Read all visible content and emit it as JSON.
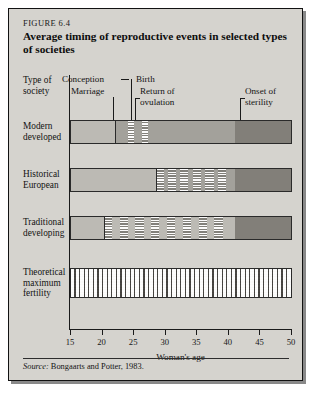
{
  "figure": {
    "number_label": "FIGURE 6.4",
    "title": "Average timing of reproductive events in selected types of societies",
    "source_prefix": "Source:",
    "source_text": "Bongaarts and Potter, 1983."
  },
  "column_heading": {
    "line1": "Type of",
    "line2": "society"
  },
  "callouts": [
    {
      "name": "conception",
      "label": "Conception",
      "age": 23.0
    },
    {
      "name": "birth",
      "label": "Birth",
      "age": 24.4
    },
    {
      "name": "marriage",
      "label": "Marriage",
      "age": 22.0
    },
    {
      "name": "return-of-ovulation",
      "label_line1": "Return of",
      "label_line2": "ovulation",
      "age": 26.4
    },
    {
      "name": "onset-of-sterility",
      "label_line1": "Onset of",
      "label_line2": "sterility",
      "age": 41.0
    }
  ],
  "rows": [
    {
      "name": "modern-developed",
      "label_line1": "Modern",
      "label_line2": "developed",
      "label_line3": ""
    },
    {
      "name": "historical-european",
      "label_line1": "Historical",
      "label_line2": "European",
      "label_line3": ""
    },
    {
      "name": "traditional-developing",
      "label_line1": "Traditional",
      "label_line2": "developing",
      "label_line3": ""
    },
    {
      "name": "theoretical-maximum-fertility",
      "label_line1": "Theoretical",
      "label_line2": "maximum",
      "label_line3": "fertility"
    }
  ],
  "colors": {
    "panel_background": "#d5d3ce",
    "bar_light": "#bcbab4",
    "bar_mid": "#a3a19b",
    "bar_dark": "#827f79",
    "frame": "#121212",
    "text": "#121212"
  },
  "chart_data": {
    "type": "bar",
    "title": "Average timing of reproductive events in selected types of societies",
    "subtitle": "FIGURE 6.4",
    "xlabel": "Woman's age",
    "ylabel": "Type of society",
    "xlim": [
      15,
      50
    ],
    "xticks": [
      15,
      20,
      25,
      30,
      35,
      40,
      45,
      50
    ],
    "grid": false,
    "legend": "none",
    "orientation": "horizontal-timeline",
    "segment_legend": [
      {
        "key": "light",
        "meaning": "not exposed / non-reproductive interval"
      },
      {
        "key": "mid",
        "meaning": "exposed to conception risk (married)"
      },
      {
        "key": "hatch",
        "meaning": "pregnancy / postpartum infecundability"
      },
      {
        "key": "dark",
        "meaning": "sterile period after onset of sterility"
      }
    ],
    "categories": [
      "Modern developed",
      "Historical European",
      "Traditional developing",
      "Theoretical maximum fertility"
    ],
    "series": [
      {
        "name": "Modern developed",
        "segments": [
          {
            "fill": "light",
            "from": 15.0,
            "to": 22.0
          },
          {
            "fill": "mid",
            "from": 22.0,
            "to": 24.0
          },
          {
            "fill": "hatch",
            "from": 24.0,
            "to": 25.0
          },
          {
            "fill": "mid",
            "from": 25.0,
            "to": 26.3
          },
          {
            "fill": "hatch",
            "from": 26.3,
            "to": 27.2
          },
          {
            "fill": "mid",
            "from": 27.2,
            "to": 41.0
          },
          {
            "fill": "dark",
            "from": 41.0,
            "to": 50.0
          }
        ],
        "rules": [
          22.0
        ]
      },
      {
        "name": "Historical European",
        "segments": [
          {
            "fill": "light",
            "from": 15.0,
            "to": 28.5
          },
          {
            "fill": "hatch",
            "from": 28.5,
            "to": 29.8
          },
          {
            "fill": "mid",
            "from": 29.8,
            "to": 30.4
          },
          {
            "fill": "hatch",
            "from": 30.4,
            "to": 31.7
          },
          {
            "fill": "mid",
            "from": 31.7,
            "to": 32.3
          },
          {
            "fill": "hatch",
            "from": 32.3,
            "to": 33.6
          },
          {
            "fill": "mid",
            "from": 33.6,
            "to": 34.3
          },
          {
            "fill": "hatch",
            "from": 34.3,
            "to": 35.6
          },
          {
            "fill": "mid",
            "from": 35.6,
            "to": 36.3
          },
          {
            "fill": "hatch",
            "from": 36.3,
            "to": 37.6
          },
          {
            "fill": "mid",
            "from": 37.6,
            "to": 38.3
          },
          {
            "fill": "hatch",
            "from": 38.3,
            "to": 39.6
          },
          {
            "fill": "mid",
            "from": 39.6,
            "to": 41.0
          },
          {
            "fill": "dark",
            "from": 41.0,
            "to": 50.0
          }
        ],
        "rules": [
          28.5
        ]
      },
      {
        "name": "Traditional developing",
        "segments": [
          {
            "fill": "light",
            "from": 15.0,
            "to": 20.2
          },
          {
            "fill": "hatch",
            "from": 20.2,
            "to": 21.5
          },
          {
            "fill": "light",
            "from": 21.5,
            "to": 22.7
          },
          {
            "fill": "hatch",
            "from": 22.7,
            "to": 24.0
          },
          {
            "fill": "light",
            "from": 24.0,
            "to": 25.2
          },
          {
            "fill": "hatch",
            "from": 25.2,
            "to": 26.5
          },
          {
            "fill": "light",
            "from": 26.5,
            "to": 27.7
          },
          {
            "fill": "hatch",
            "from": 27.7,
            "to": 29.0
          },
          {
            "fill": "light",
            "from": 29.0,
            "to": 30.2
          },
          {
            "fill": "hatch",
            "from": 30.2,
            "to": 31.5
          },
          {
            "fill": "light",
            "from": 31.5,
            "to": 32.7
          },
          {
            "fill": "hatch",
            "from": 32.7,
            "to": 34.0
          },
          {
            "fill": "light",
            "from": 34.0,
            "to": 35.2
          },
          {
            "fill": "hatch",
            "from": 35.2,
            "to": 36.5
          },
          {
            "fill": "light",
            "from": 36.5,
            "to": 37.7
          },
          {
            "fill": "hatch",
            "from": 37.7,
            "to": 39.0
          },
          {
            "fill": "light",
            "from": 39.0,
            "to": 41.0
          },
          {
            "fill": "dark",
            "from": 41.0,
            "to": 50.0
          }
        ],
        "rules": [
          20.2
        ]
      },
      {
        "name": "Theoretical maximum fertility",
        "segments": [
          {
            "fill": "dense-hatch",
            "from": 15.0,
            "to": 50.0
          }
        ],
        "rules": []
      }
    ]
  }
}
